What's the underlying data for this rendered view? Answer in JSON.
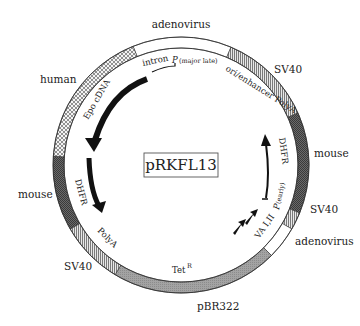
{
  "diagram": {
    "title": "pRKFL13",
    "center": {
      "x": 181,
      "y": 165
    },
    "ring": {
      "outer_radius": 128,
      "inner_radius": 117
    },
    "segments": [
      {
        "name": "adenovirus-top",
        "start": -22,
        "end": 23,
        "fill": "white",
        "label": "adenovirus"
      },
      {
        "name": "sv40-top-right",
        "start": 23,
        "end": 66,
        "fill": "hatch",
        "label": "SV40"
      },
      {
        "name": "mouse-right",
        "start": 66,
        "end": 112,
        "fill": "dark",
        "label": "mouse"
      },
      {
        "name": "sv40-right",
        "start": 112,
        "end": 120,
        "fill": "hatch",
        "label": "SV40"
      },
      {
        "name": "adenovirus-right",
        "start": 120,
        "end": 135,
        "fill": "white",
        "label": "adenovirus"
      },
      {
        "name": "pbr322-bottom",
        "start": 135,
        "end": 211,
        "fill": "gray",
        "label": "pBR322"
      },
      {
        "name": "sv40-left",
        "start": 211,
        "end": 240,
        "fill": "hatch",
        "label": "SV40"
      },
      {
        "name": "mouse-left",
        "start": 240,
        "end": 274,
        "fill": "dark",
        "label": "mouse"
      },
      {
        "name": "human-left",
        "start": 274,
        "end": 338,
        "fill": "cross",
        "label": "human"
      }
    ],
    "outer_labels": {
      "adenovirus_top": "adenovirus",
      "sv40_top_right": "SV40",
      "mouse_right": "mouse",
      "sv40_right": "SV40",
      "adenovirus_right": "adenovirus",
      "pbr322": "pBR322",
      "sv40_left": "SV40",
      "mouse_left": "mouse",
      "human": "human"
    },
    "inner_labels": {
      "intron": "intron",
      "promoter_major_late": "P",
      "promoter_major_late_sub": "(major late)",
      "ori_enhancer_polya": "ori/enhancer PolyA",
      "dhfr_right": "DHFR",
      "promoter_early": "P",
      "promoter_early_sub": "(early)",
      "va_i_ii": "VA I,II",
      "tet_r": "Tet",
      "tet_r_sup": "R",
      "polya_left": "PolyA",
      "dhfr_left": "DHFR",
      "epo_cdna": "Epo cDNA"
    },
    "colors": {
      "ring_outline": "#333333",
      "dark_fill": "#555555",
      "gray_fill": "#9a9a9a",
      "hatch_fill": "#bdbdbd",
      "arrow": "#111111"
    }
  }
}
